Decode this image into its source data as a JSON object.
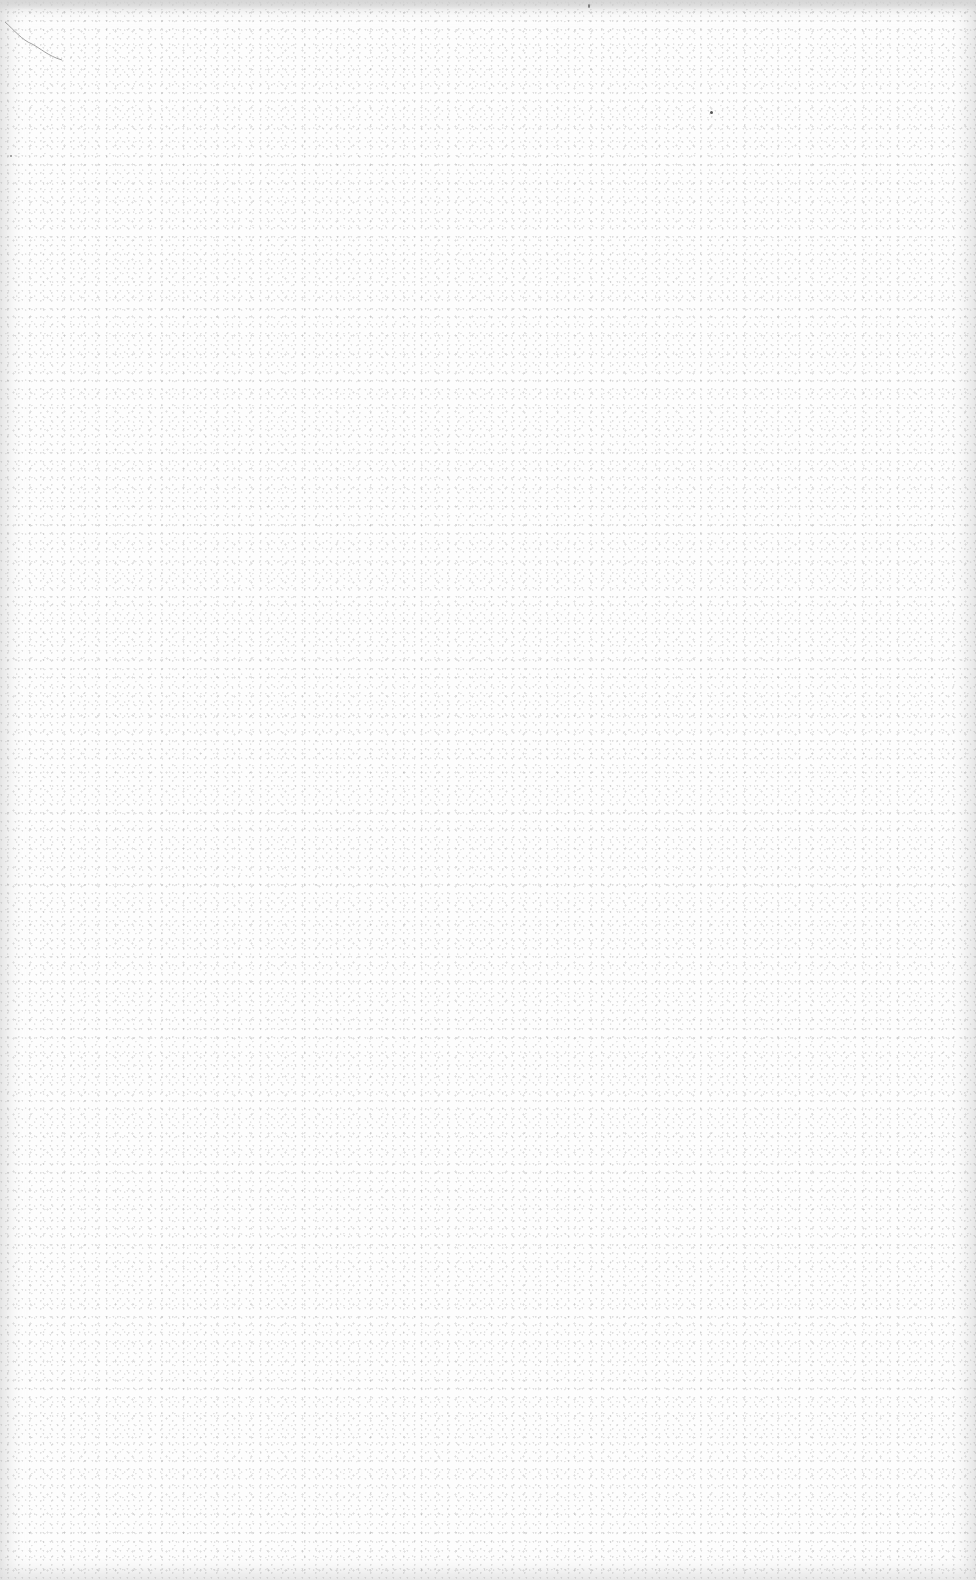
{
  "page": {
    "type": "blank-scanned-page",
    "has_text": false,
    "background_color": "#fdfdfd",
    "edge_shadow_color": "#d7d7d7",
    "speckle_color": "#969696",
    "marks": [
      {
        "kind": "fiber",
        "location": "top-left"
      },
      {
        "kind": "dot",
        "location": "upper-right"
      }
    ]
  }
}
